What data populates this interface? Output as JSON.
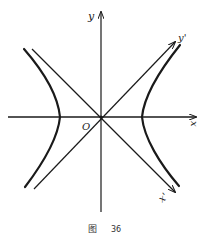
{
  "figure": {
    "caption_prefix": "图",
    "caption_number": "36",
    "labels": {
      "x_axis": "x",
      "y_axis": "y",
      "x_prime_axis": "x'",
      "y_prime_axis": "y'",
      "origin": "O"
    },
    "colors": {
      "stroke": "#1a1a1a",
      "background": "#ffffff"
    }
  }
}
